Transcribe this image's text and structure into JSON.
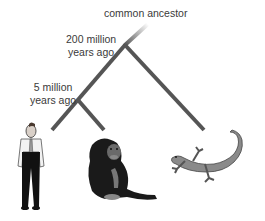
{
  "diagram": {
    "type": "phylogenetic-tree",
    "labels": {
      "root": "common ancestor",
      "node_200_line1": "200 million",
      "node_200_line2": "years ago",
      "node_5_line1": "5 million",
      "node_5_line2": "years ago"
    },
    "leaves": [
      {
        "name": "human",
        "icon": "human-figure-icon"
      },
      {
        "name": "chimpanzee",
        "icon": "chimpanzee-icon"
      },
      {
        "name": "lizard",
        "icon": "lizard-icon"
      }
    ],
    "colors": {
      "branch": "#555555",
      "text": "#3a3a3a",
      "lizard": "#8a8a8a"
    }
  }
}
